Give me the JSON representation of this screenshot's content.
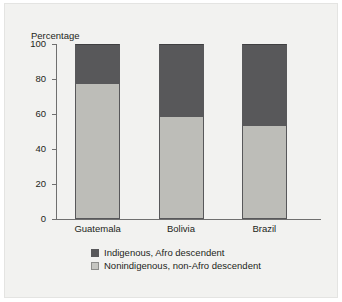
{
  "figure": {
    "background_color": "#f2f2f0",
    "frame_color": "#e4e4e2"
  },
  "chart_data": {
    "type": "bar",
    "stacked": true,
    "title": "",
    "subtitle": "",
    "xlabel": "",
    "ylabel": "Percentage",
    "ylim": [
      0,
      100
    ],
    "yticks": [
      0,
      20,
      40,
      60,
      80,
      100
    ],
    "ytick_labels": [
      "0",
      "20",
      "40",
      "60",
      "80",
      "100"
    ],
    "grid": false,
    "legend_position": "bottom",
    "categories": [
      "Guatemala",
      "Bolivia",
      "Brazil"
    ],
    "series": [
      {
        "name": "Nonindigenous, non-Afro descendent",
        "color": "#bdbdb8",
        "values": [
          78,
          59,
          54
        ]
      },
      {
        "name": "Indigenous, Afro descendent",
        "color": "#58585a",
        "values": [
          22,
          41,
          46
        ]
      }
    ],
    "legend_entries": [
      {
        "label": "Indigenous, Afro descendent",
        "color": "#58585a",
        "swatch": "dark-gray-swatch"
      },
      {
        "label": "Nonindigenous, non-Afro descendent",
        "color": "#bdbdb8",
        "swatch": "light-gray-swatch"
      }
    ]
  }
}
